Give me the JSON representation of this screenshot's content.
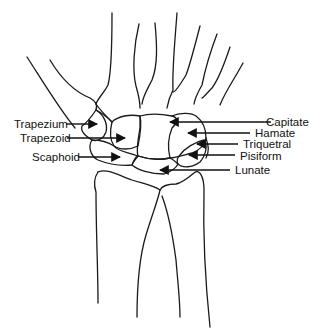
{
  "diagram": {
    "labels_left": [
      {
        "id": "trapezium",
        "text": "Trapezium"
      },
      {
        "id": "trapezoid",
        "text": "Trapezoid"
      },
      {
        "id": "scaphoid",
        "text": "Scaphoid"
      }
    ],
    "labels_right": [
      {
        "id": "capitate",
        "text": "Capitate"
      },
      {
        "id": "hamate",
        "text": "Hamate"
      },
      {
        "id": "triquetral",
        "text": "Triquetral"
      },
      {
        "id": "pisiform",
        "text": "Pisiform"
      },
      {
        "id": "lunate",
        "text": "Lunate"
      }
    ]
  },
  "colors": {
    "line": "#1a1a1a",
    "background": "#ffffff"
  }
}
